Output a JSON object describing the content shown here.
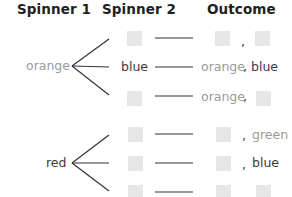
{
  "headers": {
    "spinner1": "Spinner 1",
    "spinner2": "Spinner 2",
    "outcome": "Outcome"
  },
  "branches": [
    {
      "spinner1": "orange",
      "rows": [
        {
          "spinner2": null,
          "outcome_first": null,
          "comma": ",",
          "outcome_second": null
        },
        {
          "spinner2": "blue",
          "outcome_first": "orange",
          "comma": ",",
          "outcome_second": "blue"
        },
        {
          "spinner2": null,
          "outcome_first": "orange",
          "comma": ",",
          "outcome_second": null
        }
      ]
    },
    {
      "spinner1": "red",
      "rows": [
        {
          "spinner2": null,
          "outcome_first": null,
          "comma": ",",
          "outcome_second": "green"
        },
        {
          "spinner2": null,
          "outcome_first": null,
          "comma": ",",
          "outcome_second": "blue"
        },
        {
          "spinner2": null,
          "outcome_first": null,
          "comma": null,
          "outcome_second": null
        }
      ]
    }
  ],
  "colors": {
    "orange_label": "#9a9a9a",
    "green_label": "#9a9a9a",
    "dark_label": "#3a3a3a",
    "blank_box": "#e6e6e6"
  }
}
